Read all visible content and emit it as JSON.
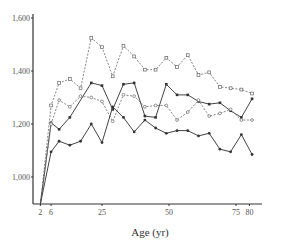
{
  "chart_data": {
    "type": "line",
    "title": "",
    "xlabel": "Age (yr)",
    "ylabel": "",
    "xlim": [
      0,
      82
    ],
    "ylim": [
      900,
      1620
    ],
    "grid": false,
    "legend": null,
    "x_ticks": [
      2,
      6,
      25,
      50,
      75,
      80
    ],
    "x_tick_labels": [
      "2",
      "6",
      "25",
      "50",
      "75",
      "80"
    ],
    "y_ticks": [
      1000,
      1200,
      1400,
      1600
    ],
    "y_tick_labels": [
      "1,000",
      "1,200",
      "1,400",
      "1,600"
    ],
    "series": [
      {
        "name": "series-top-dashed",
        "style": "dashed",
        "marker": "open-square",
        "x": [
          2,
          6,
          9,
          13,
          17,
          21,
          25,
          29,
          33,
          37,
          41,
          45,
          49,
          53,
          57,
          61,
          65,
          69,
          73,
          77,
          81
        ],
        "values": [
          880,
          1270,
          1355,
          1370,
          1335,
          1525,
          1490,
          1380,
          1495,
          1455,
          1405,
          1405,
          1450,
          1415,
          1460,
          1385,
          1395,
          1340,
          1335,
          1330,
          1315
        ]
      },
      {
        "name": "series-upper-solid",
        "style": "solid",
        "marker": "filled-square",
        "x": [
          2,
          6,
          9,
          13,
          21,
          25,
          29,
          33,
          37,
          41,
          45,
          49,
          53,
          57,
          61,
          65,
          69,
          73,
          77,
          81
        ],
        "values": [
          880,
          1205,
          1180,
          1225,
          1355,
          1345,
          1255,
          1350,
          1355,
          1230,
          1225,
          1350,
          1310,
          1310,
          1285,
          1275,
          1280,
          1250,
          1225,
          1295
        ]
      },
      {
        "name": "series-lower-dashed",
        "style": "dashed",
        "marker": "open-circle",
        "x": [
          2,
          6,
          9,
          13,
          17,
          21,
          25,
          29,
          33,
          37,
          41,
          45,
          49,
          53,
          57,
          61,
          65,
          69,
          73,
          77,
          81
        ],
        "values": [
          880,
          1200,
          1290,
          1265,
          1305,
          1300,
          1285,
          1210,
          1310,
          1305,
          1265,
          1270,
          1270,
          1215,
          1245,
          1290,
          1230,
          1240,
          1255,
          1215,
          1215
        ]
      },
      {
        "name": "series-bottom-solid",
        "style": "solid",
        "marker": "filled-circle",
        "x": [
          2,
          6,
          9,
          13,
          17,
          21,
          25,
          29,
          33,
          37,
          41,
          45,
          49,
          53,
          57,
          61,
          65,
          69,
          73,
          77,
          81
        ],
        "values": [
          880,
          1095,
          1135,
          1120,
          1135,
          1200,
          1130,
          1265,
          1225,
          1170,
          1215,
          1185,
          1165,
          1175,
          1175,
          1155,
          1165,
          1105,
          1095,
          1160,
          1085
        ]
      }
    ]
  },
  "axes": {
    "x_title": "Age (yr)"
  }
}
